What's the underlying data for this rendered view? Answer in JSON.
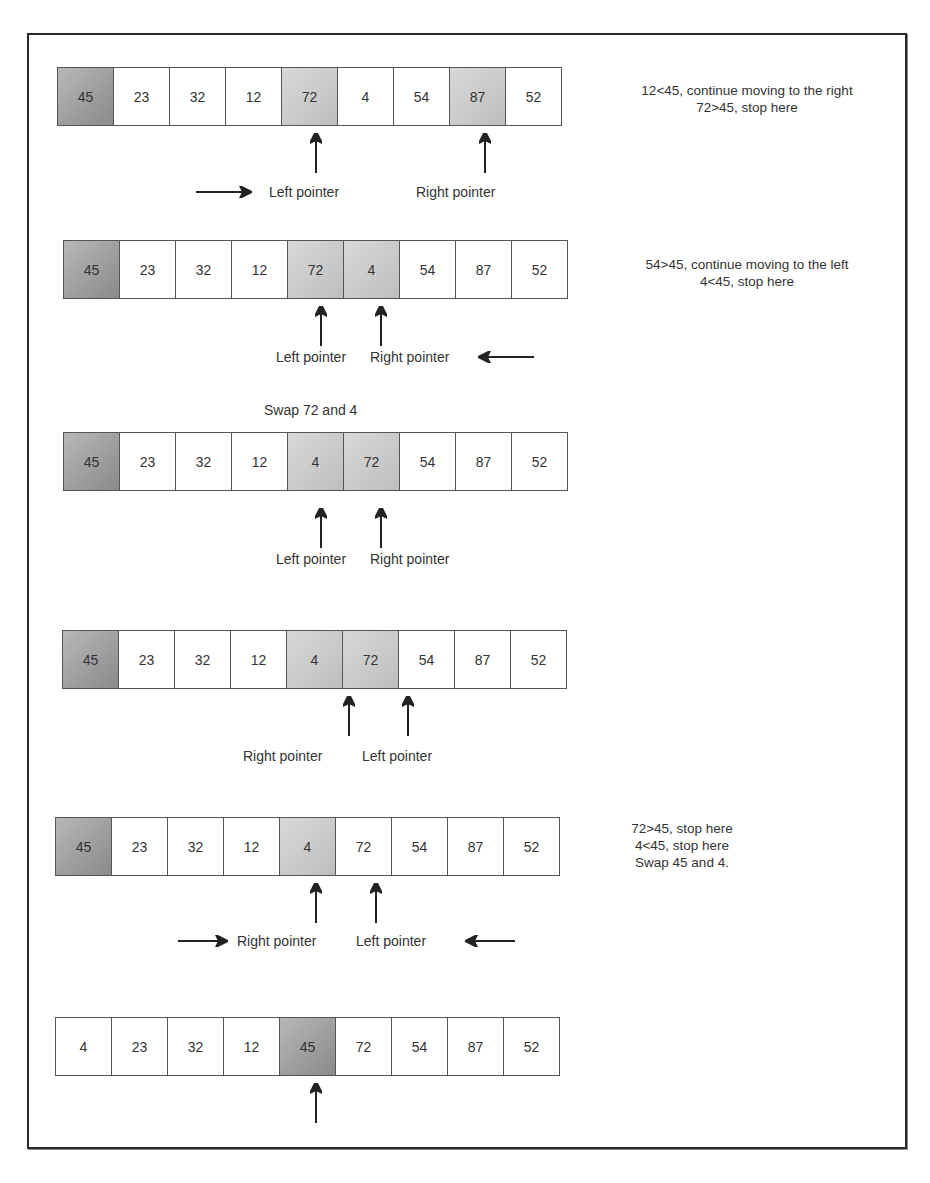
{
  "diagram": {
    "colors": {
      "pivot": "#9c9c9c",
      "highlight": "#c9c9c9",
      "border": "#555555",
      "frame": "#2a2a2a"
    },
    "steps": [
      {
        "cells": [
          "45",
          "23",
          "32",
          "12",
          "72",
          "4",
          "54",
          "87",
          "52"
        ],
        "shade": [
          "pivot",
          "",
          "",
          "",
          "hi",
          "",
          "",
          "hi",
          ""
        ],
        "labels": {
          "a": "Left pointer",
          "b": "Right pointer"
        },
        "note": [
          "12<45, continue moving to the right",
          "72>45, stop here"
        ]
      },
      {
        "cells": [
          "45",
          "23",
          "32",
          "12",
          "72",
          "4",
          "54",
          "87",
          "52"
        ],
        "shade": [
          "pivot",
          "",
          "",
          "",
          "hi",
          "hi",
          "",
          "",
          ""
        ],
        "labels": {
          "a": "Left pointer",
          "b": "Right pointer"
        },
        "note": [
          "54>45, continue moving to the left",
          "4<45, stop here"
        ],
        "caption": "Swap 72 and 4"
      },
      {
        "cells": [
          "45",
          "23",
          "32",
          "12",
          "4",
          "72",
          "54",
          "87",
          "52"
        ],
        "shade": [
          "pivot",
          "",
          "",
          "",
          "hi",
          "hi",
          "",
          "",
          ""
        ],
        "labels": {
          "a": "Left pointer",
          "b": "Right pointer"
        }
      },
      {
        "cells": [
          "45",
          "23",
          "32",
          "12",
          "4",
          "72",
          "54",
          "87",
          "52"
        ],
        "shade": [
          "pivot",
          "",
          "",
          "",
          "hi",
          "hi",
          "",
          "",
          ""
        ],
        "labels": {
          "a": "Right pointer",
          "b": "Left pointer"
        }
      },
      {
        "cells": [
          "45",
          "23",
          "32",
          "12",
          "4",
          "72",
          "54",
          "87",
          "52"
        ],
        "shade": [
          "pivot",
          "",
          "",
          "",
          "hi",
          "",
          "",
          "",
          ""
        ],
        "labels": {
          "a": "Right pointer",
          "b": "Left pointer"
        },
        "note": [
          "72>45, stop here",
          "4<45, stop here",
          "Swap 45 and 4."
        ]
      },
      {
        "cells": [
          "4",
          "23",
          "32",
          "12",
          "45",
          "72",
          "54",
          "87",
          "52"
        ],
        "shade": [
          "",
          "",
          "",
          "",
          "pivot",
          "",
          "",
          "",
          ""
        ]
      }
    ]
  }
}
